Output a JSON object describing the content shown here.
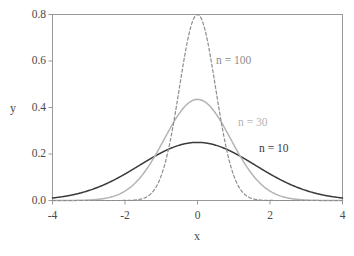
{
  "chart_data": {
    "type": "line",
    "title": "",
    "subtitle": "",
    "xlabel": "x",
    "ylabel": "y",
    "xlim": [
      -4,
      4
    ],
    "ylim": [
      0.0,
      0.8
    ],
    "grid": false,
    "legend_position": "inline-annotations",
    "x_ticks": [
      "-4",
      "-2",
      "0",
      "2",
      "4"
    ],
    "x_tick_values": [
      -4,
      -2,
      0,
      2,
      4
    ],
    "y_ticks": [
      "0.0",
      "0.2",
      "0.4",
      "0.6",
      "0.8"
    ],
    "y_tick_values": [
      0.0,
      0.2,
      0.4,
      0.6,
      0.8
    ],
    "series": [
      {
        "name": "n = 10",
        "label": "n = 10",
        "color": "#3a3a3a",
        "style": "solid",
        "peak_y": 0.25,
        "peak_x": 0,
        "sigma": 1.5958,
        "x": [
          -4.0,
          -3.6,
          -3.2,
          -2.8,
          -2.4,
          -2.0,
          -1.6,
          -1.2,
          -0.8,
          -0.4,
          0.0,
          0.4,
          0.8,
          1.2,
          1.6,
          2.0,
          2.4,
          2.8,
          3.2,
          3.6,
          4.0
        ],
        "values": [
          0.0112,
          0.0196,
          0.0324,
          0.0505,
          0.0743,
          0.1032,
          0.1355,
          0.1681,
          0.1971,
          0.2185,
          0.25,
          0.2185,
          0.1971,
          0.1681,
          0.1355,
          0.1032,
          0.0743,
          0.0505,
          0.0324,
          0.0196,
          0.0112
        ]
      },
      {
        "name": "n = 30",
        "label": "n = 30",
        "color": "#b4b4b4",
        "style": "solid",
        "peak_y": 0.435,
        "peak_x": 0,
        "sigma": 0.9172,
        "x": [
          -4.0,
          -3.6,
          -3.2,
          -2.8,
          -2.4,
          -2.0,
          -1.6,
          -1.2,
          -0.8,
          -0.4,
          0.0,
          0.4,
          0.8,
          1.2,
          1.6,
          2.0,
          2.4,
          2.8,
          3.2,
          3.6,
          4.0
        ],
        "values": [
          0.0,
          0.0002,
          0.0011,
          0.0043,
          0.0144,
          0.04,
          0.0934,
          0.1827,
          0.2999,
          0.4131,
          0.435,
          0.4131,
          0.2999,
          0.1827,
          0.0934,
          0.04,
          0.0144,
          0.0043,
          0.0011,
          0.0002,
          0.0
        ]
      },
      {
        "name": "n = 100",
        "label": "n = 100",
        "color": "#8c8c8c",
        "style": "dashed",
        "peak_y": 0.8,
        "peak_x": 0,
        "sigma": 0.4987,
        "x": [
          -4.0,
          -3.6,
          -3.2,
          -2.8,
          -2.4,
          -2.0,
          -1.6,
          -1.2,
          -0.8,
          -0.4,
          0.0,
          0.4,
          0.8,
          1.2,
          1.6,
          2.0,
          2.4,
          2.8,
          3.2,
          3.6,
          4.0
        ],
        "values": [
          0.0,
          0.0,
          0.0,
          0.0,
          0.0,
          0.0002,
          0.005,
          0.0596,
          0.2665,
          0.5954,
          0.8,
          0.5954,
          0.2665,
          0.0596,
          0.005,
          0.0002,
          0.0,
          0.0,
          0.0,
          0.0,
          0.0
        ]
      }
    ],
    "annotations": [
      {
        "text": "n = 100",
        "color": "#8c8c8c"
      },
      {
        "text": "n = 30",
        "color": "#b4b4b4"
      },
      {
        "text": "n = 10",
        "color": "#3a3a3a"
      }
    ]
  },
  "axes": {
    "x_title": "x",
    "y_title": "y",
    "x_tick_labels": [
      "-4",
      "-2",
      "0",
      "2",
      "4"
    ],
    "y_tick_labels": [
      "0.0",
      "0.2",
      "0.4",
      "0.6",
      "0.8"
    ]
  },
  "colors": {
    "frame": "#999999",
    "tick_text": "#4a4a4a",
    "background": "#ffffff",
    "curve_n10": "#3a3a3a",
    "curve_n30": "#b4b4b4",
    "curve_n100": "#8c8c8c"
  }
}
